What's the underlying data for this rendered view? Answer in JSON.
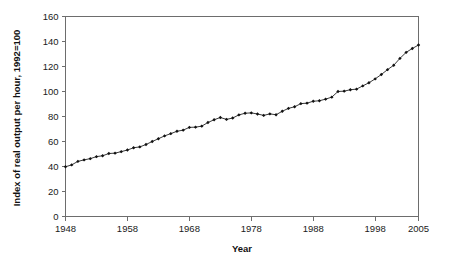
{
  "chart_data": {
    "type": "line",
    "title": "",
    "xlabel": "Year",
    "ylabel": "Index of real output per hour, 1992=100",
    "xlim": [
      1948,
      2005
    ],
    "ylim": [
      0,
      160
    ],
    "grid": false,
    "legend": "none",
    "xticks": [
      1948,
      1958,
      1968,
      1978,
      1988,
      1998,
      2005
    ],
    "xtick_labels": [
      "1948",
      "1958",
      "1968",
      "1978",
      "1988",
      "1998",
      "2005"
    ],
    "yticks": [
      0,
      20,
      40,
      60,
      80,
      100,
      120,
      140,
      160
    ],
    "ytick_labels": [
      "0",
      "20",
      "40",
      "60",
      "80",
      "100",
      "120",
      "140",
      "160"
    ],
    "series": [
      {
        "name": "Index of real output per hour",
        "marker": "diamond",
        "x": [
          1948,
          1949,
          1950,
          1951,
          1952,
          1953,
          1954,
          1955,
          1956,
          1957,
          1958,
          1959,
          1960,
          1961,
          1962,
          1963,
          1964,
          1965,
          1966,
          1967,
          1968,
          1969,
          1970,
          1971,
          1972,
          1973,
          1974,
          1975,
          1976,
          1977,
          1978,
          1979,
          1980,
          1981,
          1982,
          1983,
          1984,
          1985,
          1986,
          1987,
          1988,
          1989,
          1990,
          1991,
          1992,
          1993,
          1994,
          1995,
          1996,
          1997,
          1998,
          1999,
          2000,
          2001,
          2002,
          2003,
          2004,
          2005
        ],
        "y": [
          39.8,
          41.3,
          44.1,
          45.3,
          46.3,
          47.9,
          48.6,
          50.4,
          50.7,
          51.9,
          53.2,
          55.0,
          55.7,
          57.6,
          60.0,
          62.2,
          64.5,
          66.3,
          68.2,
          69.1,
          71.3,
          71.5,
          72.3,
          75.2,
          77.4,
          79.2,
          77.7,
          78.8,
          81.3,
          82.6,
          82.9,
          82.0,
          80.9,
          82.1,
          81.4,
          84.2,
          86.5,
          87.8,
          90.3,
          90.7,
          92.2,
          92.6,
          93.9,
          95.5,
          100.0,
          100.3,
          101.4,
          101.9,
          104.5,
          107.0,
          110.1,
          113.6,
          117.5,
          121.0,
          126.5,
          131.3,
          134.4,
          137.2
        ]
      }
    ]
  },
  "axes": {
    "x_title": "Year",
    "y_title": "Index of real output per hour, 1992=100"
  }
}
